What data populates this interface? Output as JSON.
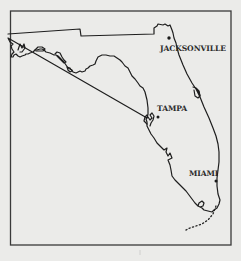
{
  "map": {
    "title": "Florida",
    "background_color": "#ebebe9",
    "line_color": "#1e1e1e",
    "cities": [
      {
        "name": "JACKSONVILLE",
        "dot": [
          169,
          38
        ],
        "label_pos": [
          160,
          51
        ]
      },
      {
        "name": "TAMPA",
        "dot": [
          158,
          117
        ],
        "label_pos": [
          157,
          111
        ]
      },
      {
        "name": "MIAMI",
        "dot": [
          216,
          181
        ],
        "label_pos": [
          189,
          176
        ]
      }
    ]
  }
}
